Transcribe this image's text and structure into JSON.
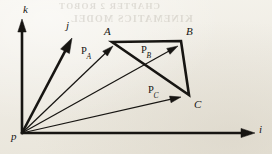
{
  "figure": {
    "kind": "vector-diagram",
    "background_color": "#efece4",
    "ink_color": "#171512",
    "width": 272,
    "height": 154
  },
  "bleed_through": {
    "line_1": "CHAPTER 2  ROBOT",
    "line_2": "KINEMATICS MODEL"
  },
  "axes": {
    "origin": {
      "label": "p",
      "x": 22,
      "y": 133,
      "label_x": 11,
      "label_y": 131
    },
    "items": [
      {
        "name": "k-axis",
        "label": "k",
        "tip_x": 22,
        "tip_y": 19,
        "label_x": 23,
        "label_y": 4,
        "stroke_width": 2.6,
        "head_len": 13,
        "head_half_width": 4.2
      },
      {
        "name": "j-axis",
        "label": "j",
        "tip_x": 72,
        "tip_y": 38,
        "label_x": 66,
        "label_y": 20,
        "stroke_width": 2.6,
        "head_len": 15,
        "head_half_width": 5.0
      },
      {
        "name": "i-axis",
        "label": "i",
        "tip_x": 255,
        "tip_y": 133,
        "label_x": 259,
        "label_y": 124,
        "stroke_width": 2.6,
        "head_len": 14,
        "head_half_width": 4.6
      }
    ]
  },
  "position_vectors": [
    {
      "name": "vector-pa",
      "base": "P",
      "subscript": "A",
      "tip_x": 113,
      "tip_y": 46,
      "label_x": 81,
      "label_y": 46,
      "stroke_width": 1.25,
      "head_len": 11,
      "head_half_width": 3.4
    },
    {
      "name": "vector-pb",
      "base": "P",
      "subscript": "B",
      "tip_x": 178,
      "tip_y": 46,
      "label_x": 141,
      "label_y": 45,
      "stroke_width": 1.25,
      "head_len": 11,
      "head_half_width": 3.4
    },
    {
      "name": "vector-pc",
      "base": "P",
      "subscript": "C",
      "tip_x": 181,
      "tip_y": 97,
      "label_x": 148,
      "label_y": 85,
      "stroke_width": 1.25,
      "head_len": 11,
      "head_half_width": 3.4
    }
  ],
  "triangle": {
    "name": "triangle-abc",
    "stroke_width": 2.6,
    "vertices": [
      {
        "label": "A",
        "x": 112,
        "y": 42,
        "label_x": 104,
        "label_y": 26
      },
      {
        "label": "B",
        "x": 181,
        "y": 41,
        "label_x": 186,
        "label_y": 26
      },
      {
        "label": "C",
        "x": 189,
        "y": 95,
        "label_x": 194,
        "label_y": 99
      }
    ]
  }
}
